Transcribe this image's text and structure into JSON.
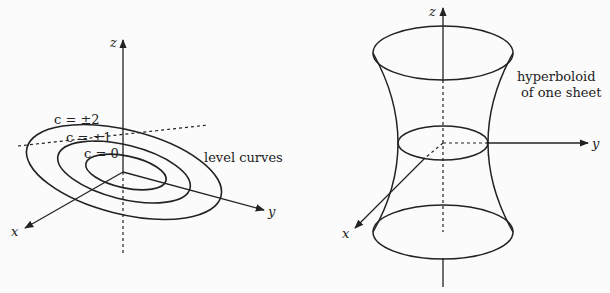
{
  "left_figure": {
    "axes": {
      "z": "z",
      "y": "y",
      "x": "x"
    },
    "level_labels": [
      "c = ±2",
      "c = ±1",
      "c = 0"
    ],
    "annotation": "level curves"
  },
  "right_figure": {
    "axes": {
      "z": "z",
      "y": "y",
      "x": "x"
    },
    "annotation_line1": "hyperboloid",
    "annotation_line2": "of one sheet"
  }
}
